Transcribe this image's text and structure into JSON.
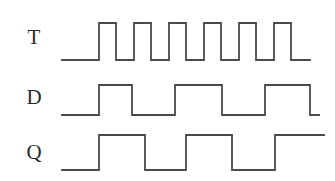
{
  "figure": {
    "kind": "digital-timing-diagram",
    "background_color": "#ffffff",
    "trace_color": "#4a4a4a",
    "label_color": "#2b2b2b",
    "width": 335,
    "height": 181
  },
  "labels": {
    "t": "T",
    "d": "D",
    "q": "Q"
  },
  "chart_data": {
    "type": "line",
    "title": "",
    "xlabel": "",
    "ylabel": "",
    "grid": false,
    "legend": "none",
    "xlim": [
      62,
      325
    ],
    "series": [
      {
        "name": "T",
        "description": "toggle clock input, 5 full pulses plus trailing partial",
        "low_y": 60,
        "high_y": 23,
        "x_start": 62,
        "x_end": 310,
        "initial_level": "low",
        "final_level": "low",
        "transitions": [
          {
            "x": 99,
            "edge": "rise"
          },
          {
            "x": 116,
            "edge": "fall"
          },
          {
            "x": 134,
            "edge": "rise"
          },
          {
            "x": 151,
            "edge": "fall"
          },
          {
            "x": 169,
            "edge": "rise"
          },
          {
            "x": 186,
            "edge": "fall"
          },
          {
            "x": 204,
            "edge": "rise"
          },
          {
            "x": 221,
            "edge": "fall"
          },
          {
            "x": 239,
            "edge": "rise"
          },
          {
            "x": 256,
            "edge": "fall"
          },
          {
            "x": 274,
            "edge": "rise"
          },
          {
            "x": 291,
            "edge": "fall"
          }
        ]
      },
      {
        "name": "D",
        "description": "divide-by-two style waveform, 3 wide pulses",
        "low_y": 115,
        "high_y": 85,
        "x_start": 62,
        "x_end": 319,
        "initial_level": "low",
        "final_level": "low",
        "transitions": [
          {
            "x": 99,
            "edge": "rise"
          },
          {
            "x": 132,
            "edge": "fall"
          },
          {
            "x": 175,
            "edge": "rise"
          },
          {
            "x": 222,
            "edge": "fall"
          },
          {
            "x": 265,
            "edge": "rise"
          },
          {
            "x": 310,
            "edge": "fall"
          }
        ]
      },
      {
        "name": "Q",
        "description": "flip-flop output, 3 pulses, ends high",
        "low_y": 170,
        "high_y": 135,
        "x_start": 62,
        "x_end": 324,
        "initial_level": "low",
        "final_level": "high",
        "transitions": [
          {
            "x": 99,
            "edge": "rise"
          },
          {
            "x": 145,
            "edge": "fall"
          },
          {
            "x": 186,
            "edge": "rise"
          },
          {
            "x": 232,
            "edge": "fall"
          },
          {
            "x": 275,
            "edge": "rise"
          }
        ]
      }
    ]
  }
}
